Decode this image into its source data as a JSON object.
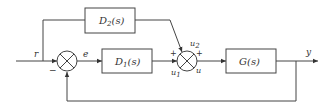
{
  "diagram": {
    "type": "block-diagram",
    "blocks": {
      "d1": {
        "name": "D",
        "sub": "1",
        "arg": "(s)"
      },
      "d2": {
        "name": "D",
        "sub": "2",
        "arg": "(s)"
      },
      "g": {
        "label": "G(s)"
      }
    },
    "signals": {
      "r": "r",
      "e": "e",
      "u1": {
        "name": "u",
        "sub": "1"
      },
      "u2": {
        "name": "u",
        "sub": "2"
      },
      "u": "u",
      "y": "y"
    },
    "signs": {
      "sum1_feedback": "−",
      "sum2_u1": "+",
      "sum2_u2": "+"
    }
  }
}
